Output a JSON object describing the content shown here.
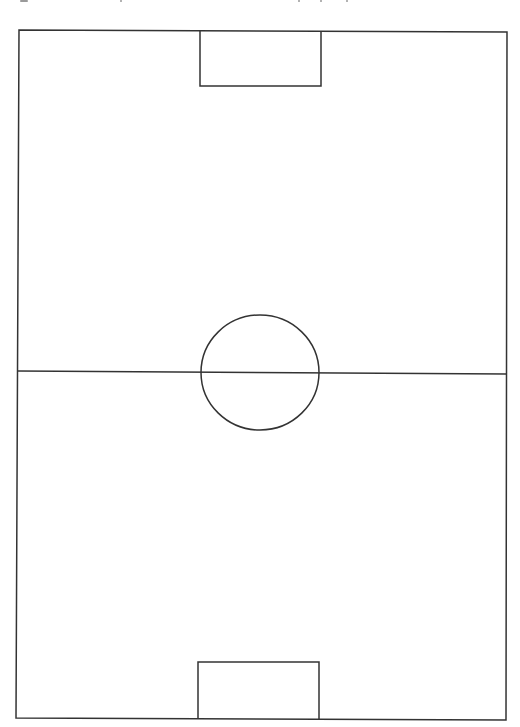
{
  "diagram": {
    "title": "",
    "orientation": "vertical",
    "background_color": "#ffffff",
    "line_color": "#333333",
    "elements": [
      {
        "name": "touchline-boundary",
        "kind": "rectangle"
      },
      {
        "name": "halfway-line",
        "kind": "line"
      },
      {
        "name": "center-circle",
        "kind": "circle"
      },
      {
        "name": "top-goal-area",
        "kind": "rectangle"
      },
      {
        "name": "bottom-goal-area",
        "kind": "rectangle"
      }
    ],
    "labels": []
  }
}
